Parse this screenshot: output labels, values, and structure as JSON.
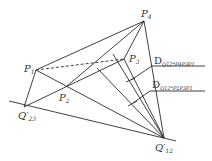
{
  "diagram": {
    "type": "geometric-construction",
    "points": {
      "P1": {
        "label": "P",
        "sub": "1",
        "x": 36,
        "y": 70
      },
      "P2": {
        "label": "P",
        "sub": "2",
        "x": 67,
        "y": 86
      },
      "P3": {
        "label": "P",
        "sub": "3",
        "x": 124,
        "y": 59
      },
      "P4": {
        "label": "P",
        "sub": "4",
        "x": 144,
        "y": 21
      },
      "Q23": {
        "label": "Q′",
        "sub": "23",
        "x": 24,
        "y": 107
      },
      "Q12": {
        "label": "Q′",
        "sub": "12",
        "x": 164,
        "y": 138
      }
    },
    "annotations": [
      {
        "main": "D",
        "sub": "Q12*P4P3P1"
      },
      {
        "main": "D",
        "sub": "Q12*P2P3P1"
      }
    ]
  }
}
